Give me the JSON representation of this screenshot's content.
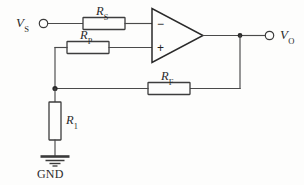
{
  "diagram": {
    "type": "circuit-schematic",
    "colors": {
      "background": "#fdfdfc",
      "wire": "#4a4a4a",
      "component_outline": "#3d3d3d",
      "label_text": "#2b2b2b"
    }
  },
  "terminals": [
    {
      "id": "input",
      "symbol": "V",
      "subscript": "S",
      "kind": "open-circle-terminal",
      "side": "left"
    },
    {
      "id": "output",
      "symbol": "V",
      "subscript": "O",
      "kind": "open-circle-terminal",
      "side": "right"
    }
  ],
  "components": [
    {
      "id": "rs",
      "type": "resistor",
      "symbol": "R",
      "subscript": "S",
      "orientation": "horizontal",
      "branch": "source-to-inverting-input"
    },
    {
      "id": "rp",
      "type": "resistor",
      "symbol": "R",
      "subscript": "P",
      "orientation": "horizontal",
      "branch": "node-to-noninverting-input"
    },
    {
      "id": "rf",
      "type": "resistor",
      "symbol": "R",
      "subscript": "F",
      "orientation": "horizontal",
      "branch": "output-feedback-to-node"
    },
    {
      "id": "r1",
      "type": "resistor",
      "symbol": "R",
      "subscript": "1",
      "orientation": "vertical",
      "branch": "node-to-ground"
    }
  ],
  "opamp": {
    "id": "u1",
    "type": "operational-amplifier",
    "inverting_pin_label": "−",
    "noninverting_pin_label": "+",
    "inverting_pin_position": "top",
    "noninverting_pin_position": "bottom"
  },
  "ground": {
    "id": "gnd",
    "label": "GND",
    "symbol": "earth-ground"
  },
  "nodes": [
    {
      "id": "node-divider",
      "has_junction_dot": true
    },
    {
      "id": "node-output",
      "has_junction_dot": true
    }
  ]
}
